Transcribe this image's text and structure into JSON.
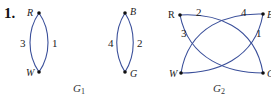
{
  "problem_number": "1.",
  "colors": {
    "edge": "#3a4f9a",
    "vertex": "#111111"
  },
  "graphs": [
    {
      "name": "G",
      "subscript": "1",
      "vertices": [
        {
          "id": "R",
          "label": "R"
        },
        {
          "id": "W",
          "label": "W"
        }
      ],
      "edges": [
        {
          "from": "R",
          "to": "W",
          "label": "3",
          "side": "left"
        },
        {
          "from": "R",
          "to": "W",
          "label": "1",
          "side": "right"
        }
      ]
    },
    {
      "name": "G",
      "subscript": "1",
      "component": "second",
      "vertices": [
        {
          "id": "B",
          "label": "B"
        },
        {
          "id": "G",
          "label": "G"
        }
      ],
      "edges": [
        {
          "from": "B",
          "to": "G",
          "label": "4",
          "side": "left"
        },
        {
          "from": "B",
          "to": "G",
          "label": "2",
          "side": "right"
        }
      ]
    },
    {
      "name": "G",
      "subscript": "2",
      "vertices": [
        {
          "id": "R",
          "label": "R"
        },
        {
          "id": "B",
          "label": "B"
        },
        {
          "id": "W",
          "label": "W"
        },
        {
          "id": "G",
          "label": "G"
        }
      ],
      "edges": [
        {
          "from": "R",
          "to": "G",
          "label": "2"
        },
        {
          "from": "W",
          "to": "B",
          "label": "4"
        },
        {
          "from": "R",
          "to": "G",
          "label": "3"
        },
        {
          "from": "W",
          "to": "B",
          "label": "1"
        }
      ]
    }
  ],
  "captions": {
    "g1": {
      "name": "G",
      "sub": "1"
    },
    "g2": {
      "name": "G",
      "sub": "2"
    }
  }
}
